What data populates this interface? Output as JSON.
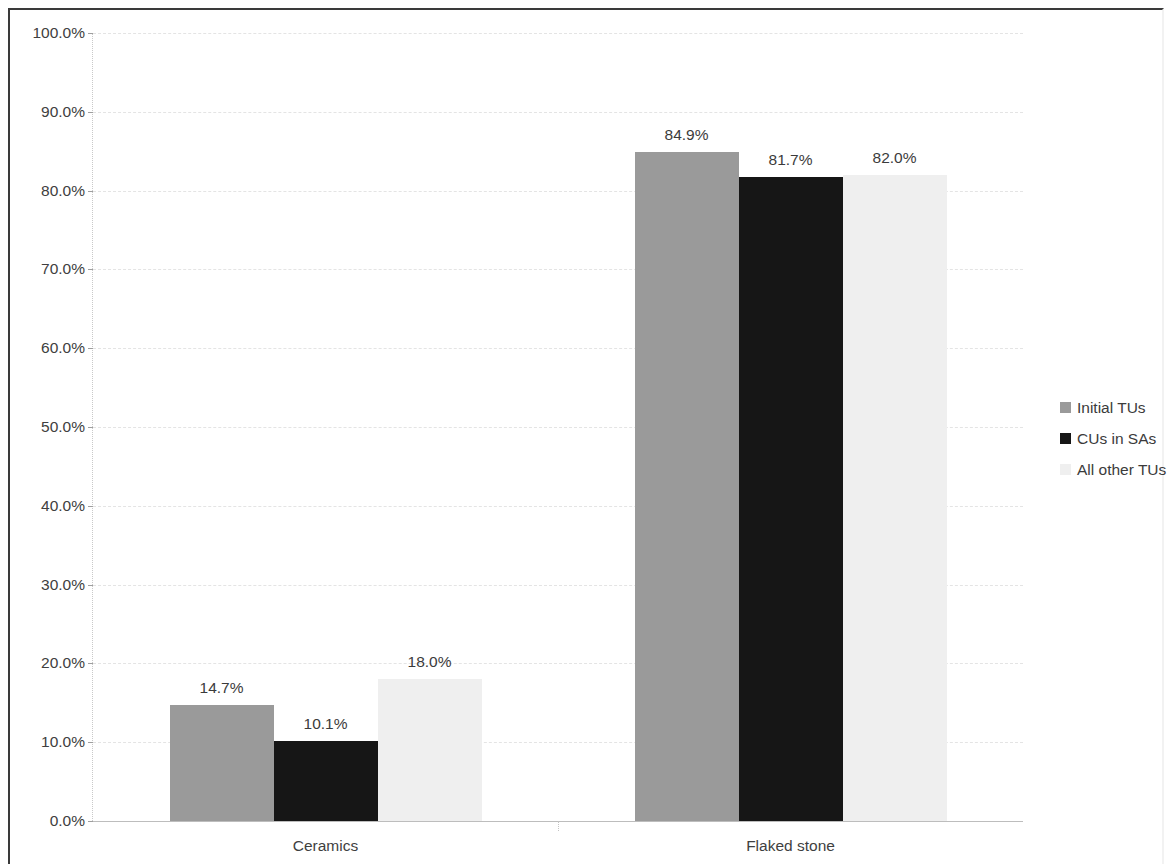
{
  "chart_data": {
    "type": "bar",
    "title": "",
    "subtitle": "",
    "xlabel": "",
    "ylabel": "",
    "categories": [
      "Ceramics",
      "Flaked stone"
    ],
    "series": [
      {
        "name": "Initial TUs",
        "color": "#9a9a9a",
        "values": [
          14.7,
          84.9
        ],
        "labels": [
          "14.7%",
          "84.9%"
        ]
      },
      {
        "name": "CUs in SAs",
        "color": "#161616",
        "values": [
          10.1,
          81.7
        ],
        "labels": [
          "10.1%",
          "81.7%"
        ]
      },
      {
        "name": "All other TUs",
        "color": "#efefef",
        "values": [
          18.0,
          82.0
        ],
        "labels": [
          "18.0%",
          "82.0%"
        ]
      }
    ],
    "ylim": [
      0,
      100
    ],
    "ytick_values": [
      0,
      10,
      20,
      30,
      40,
      50,
      60,
      70,
      80,
      90,
      100
    ],
    "ytick_labels": [
      "0.0%",
      "10.0%",
      "20.0%",
      "30.0%",
      "40.0%",
      "50.0%",
      "60.0%",
      "70.0%",
      "80.0%",
      "90.0%",
      "100.0%"
    ],
    "grid": true,
    "grid_axis": "y",
    "legend_position": "right",
    "value_labels": true,
    "background_color": "#ffffff",
    "gridline_color": "#e4e4e4",
    "axis_text_color": "#404040"
  },
  "legend": {
    "items": [
      {
        "label": "Initial TUs"
      },
      {
        "label": "CUs in SAs"
      },
      {
        "label": "All other TUs"
      }
    ]
  },
  "axis": {
    "y_labels": [
      "100.0%",
      "90.0%",
      "80.0%",
      "70.0%",
      "60.0%",
      "50.0%",
      "40.0%",
      "30.0%",
      "20.0%",
      "10.0%",
      "0.0%"
    ],
    "x_labels": [
      "Ceramics",
      "Flaked stone"
    ]
  }
}
